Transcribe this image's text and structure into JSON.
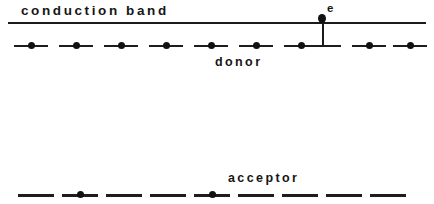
{
  "figure": {
    "background_color": "#ffffff",
    "ink_color": "#161616",
    "width": 434,
    "height": 204
  },
  "labels": {
    "conduction_band": "conduction band",
    "donor": "donor",
    "acceptor": "acceptor",
    "electron": "e"
  },
  "bands": {
    "conduction_band_line": {
      "x_start": 8,
      "x_end": 426,
      "y": 22,
      "thickness": 2
    }
  },
  "donor_level": {
    "y": 45,
    "count": 9,
    "segment_width": 34,
    "pitch": 45,
    "x_start": 14,
    "states": [
      {
        "index": 0,
        "x": 14,
        "occupied": true
      },
      {
        "index": 1,
        "x": 59,
        "occupied": true
      },
      {
        "index": 2,
        "x": 104,
        "occupied": true
      },
      {
        "index": 3,
        "x": 149,
        "occupied": true
      },
      {
        "index": 4,
        "x": 194,
        "occupied": true
      },
      {
        "index": 5,
        "x": 239,
        "occupied": true
      },
      {
        "index": 6,
        "x": 284,
        "occupied": true
      },
      {
        "index": 7,
        "x": 307,
        "occupied": false,
        "ionized": true
      },
      {
        "index": 8,
        "x": 352,
        "occupied": true
      },
      {
        "index": 9,
        "x": 393,
        "occupied": true
      }
    ]
  },
  "acceptor_level": {
    "y": 194,
    "count": 9,
    "segment_width": 36,
    "pitch": 45,
    "x_start": 18,
    "states": [
      {
        "index": 0,
        "x": 18,
        "occupied": false
      },
      {
        "index": 1,
        "x": 62,
        "occupied": true
      },
      {
        "index": 2,
        "x": 106,
        "occupied": false
      },
      {
        "index": 3,
        "x": 150,
        "occupied": false
      },
      {
        "index": 4,
        "x": 194,
        "occupied": true
      },
      {
        "index": 5,
        "x": 238,
        "occupied": false
      },
      {
        "index": 6,
        "x": 282,
        "occupied": false
      },
      {
        "index": 7,
        "x": 326,
        "occupied": false
      },
      {
        "index": 8,
        "x": 370,
        "occupied": false
      }
    ]
  },
  "ionization": {
    "x": 322,
    "y_top": 14,
    "y_bottom": 46,
    "electron_label": "e",
    "description": "donor ionization"
  }
}
